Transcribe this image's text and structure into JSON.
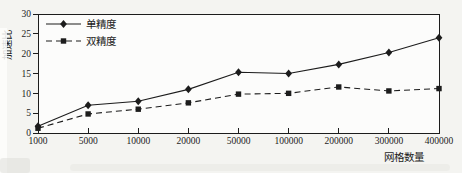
{
  "figure": {
    "background": "#f4f4f1",
    "plot_background": "#fcfcfb",
    "line_color": "#1c1c1c",
    "text_color": "#1c1c1c"
  },
  "chart_data": {
    "type": "line",
    "title": "",
    "xlabel": "网格数量",
    "ylabel": "加速比",
    "categories": [
      "1000",
      "5000",
      "10000",
      "20000",
      "50000",
      "100000",
      "200000",
      "300000",
      "400000"
    ],
    "ylim": [
      0,
      30
    ],
    "yticks": [
      0,
      5,
      10,
      15,
      20,
      25,
      30
    ],
    "grid": false,
    "legend_position": "top-left-inside",
    "series": [
      {
        "name": "单精度",
        "marker": "diamond",
        "line_style": "solid",
        "values": [
          1.7,
          7,
          8,
          11,
          15.3,
          15,
          17.3,
          20.3,
          24
        ]
      },
      {
        "name": "双精度",
        "marker": "square",
        "line_style": "dashed",
        "values": [
          1.2,
          4.8,
          6,
          7.6,
          9.8,
          10,
          11.6,
          10.6,
          11.2
        ]
      }
    ]
  }
}
